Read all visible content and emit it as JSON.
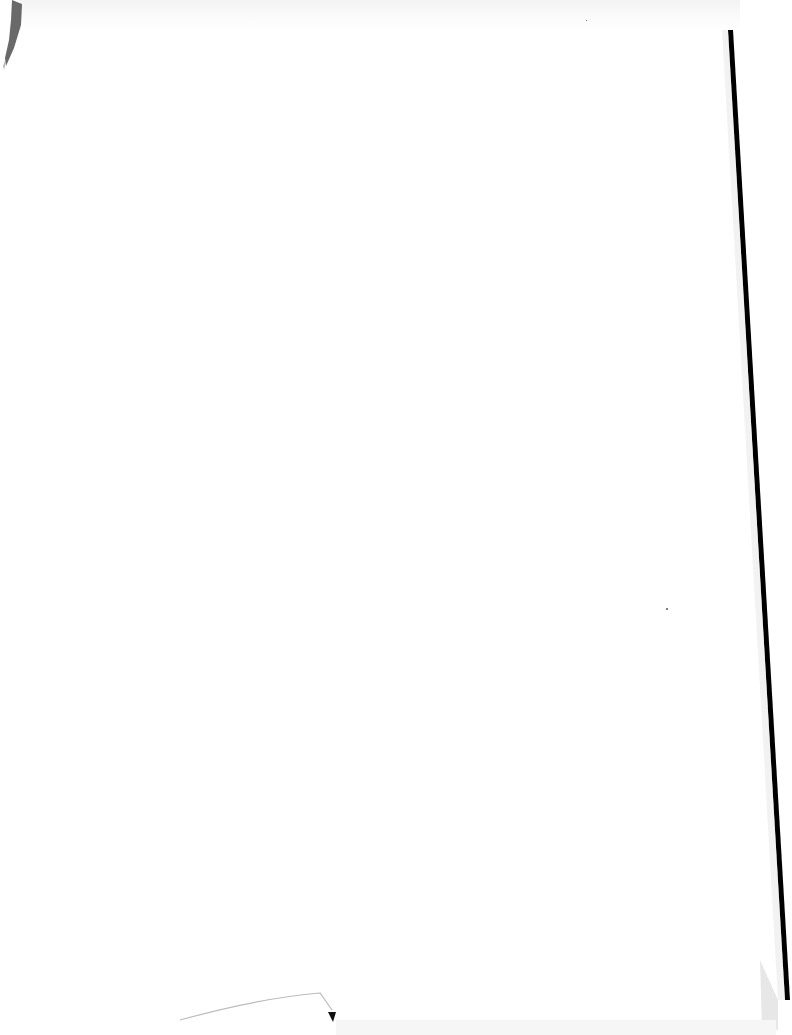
{
  "document": {
    "type": "scanned-blank-page",
    "text_content": "",
    "artifacts": {
      "top_left_smudge": "dark-smudge",
      "right_edge": "scanner-shadow-line",
      "bottom_edge": "curled-paper-corner",
      "top_edge": "faint-grey-band"
    }
  },
  "colors": {
    "paper": "#ffffff",
    "edge_shadow": "#000000",
    "smudge": "#555555",
    "curl_line": "#bbbbbb"
  }
}
